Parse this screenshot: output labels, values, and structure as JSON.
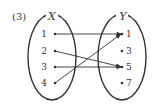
{
  "problem_number": "(3)",
  "set_x": {
    "label": "X",
    "elements": [
      "1",
      "2",
      "3",
      "4"
    ]
  },
  "set_y": {
    "label": "Y",
    "elements": [
      "1",
      "3",
      "5",
      "7"
    ]
  },
  "mappings": [
    {
      "from": "1",
      "to": "1"
    },
    {
      "from": "2",
      "to": "5"
    },
    {
      "from": "3",
      "to": "5"
    },
    {
      "from": "4",
      "to": "1"
    }
  ],
  "colors": {
    "stroke": "#333333",
    "background": "#ffffff"
  }
}
